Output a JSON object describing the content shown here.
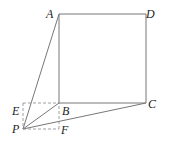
{
  "diagram": {
    "type": "geometry",
    "points": {
      "A": {
        "label": "A",
        "x": 59,
        "y": 14
      },
      "B": {
        "label": "B",
        "x": 59,
        "y": 103
      },
      "C": {
        "label": "C",
        "x": 146,
        "y": 103
      },
      "D": {
        "label": "D",
        "x": 146,
        "y": 14
      },
      "E": {
        "label": "E",
        "x": 23,
        "y": 103
      },
      "F": {
        "label": "F",
        "x": 59,
        "y": 129
      },
      "P": {
        "label": "P",
        "x": 23,
        "y": 129
      }
    },
    "solid_segments": [
      "AB",
      "BC",
      "CD",
      "DA",
      "PA",
      "PB",
      "PC"
    ],
    "dashed_segments": [
      "EB",
      "EP",
      "PF",
      "FB"
    ],
    "colors": {
      "line": "#777777",
      "label": "#222222"
    }
  }
}
